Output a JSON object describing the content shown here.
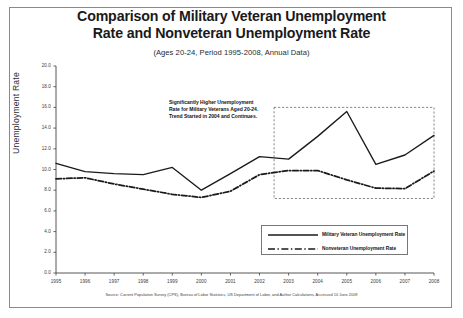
{
  "figure": {
    "title": "Comparison of Military Veteran Unemployment Rate and Nonveteran Unemployment Rate",
    "title_line1": "Comparison of Military Veteran Unemployment",
    "title_line2": "Rate and Nonveteran Unemployment Rate",
    "subtitle": "(Ages 20-24, Period 1995-2008, Annual Data)",
    "source_note": "Source: Current Population Survey (CPS), Bureau of Labor Statistics, US Department of Labor, and Author Calculations, Accessed 10 June 2009",
    "annotation": "Significantly Higher Unemployment Rate for Military Veterans Aged 20-24. Trend Started in 2004 and Continues.",
    "annotation_lines": [
      "Significantly Higher Unemployment",
      "Rate for Military Veterans Aged 20-24.",
      "Trend Started in 2004 and Continues."
    ]
  },
  "colors": {
    "line": "#1a1a1a",
    "frame": "#8a8a8a",
    "axis": "#444444",
    "highlight_box": "#555555",
    "background": "#ffffff"
  },
  "chart_data": {
    "type": "line",
    "title": "Comparison of Military Veteran Unemployment Rate and Nonveteran Unemployment Rate",
    "subtitle": "(Ages 20-24, Period 1995-2008, Annual Data)",
    "xlabel": "",
    "ylabel": "Unemployment Rate",
    "x": [
      1995,
      1996,
      1997,
      1998,
      1999,
      2000,
      2001,
      2002,
      2003,
      2004,
      2005,
      2006,
      2007,
      2008
    ],
    "categories": [
      "1995",
      "1996",
      "1997",
      "1998",
      "1999",
      "2000",
      "2001",
      "2002",
      "2003",
      "2004",
      "2005",
      "2006",
      "2007",
      "2008"
    ],
    "xlim": [
      1995,
      2008
    ],
    "ylim": [
      0.0,
      20.0
    ],
    "ytick_labels": [
      "0.0",
      "2.0",
      "4.0",
      "6.0",
      "8.0",
      "10.0",
      "12.0",
      "14.0",
      "16.0",
      "18.0",
      "20.0"
    ],
    "yticks": [
      0.0,
      2.0,
      4.0,
      6.0,
      8.0,
      10.0,
      12.0,
      14.0,
      16.0,
      18.0,
      20.0
    ],
    "grid": false,
    "legend_position": "lower right",
    "series": [
      {
        "name": "Military Veteran Unemployment Rate",
        "style": "solid",
        "values": [
          10.6,
          9.8,
          9.6,
          9.5,
          10.2,
          8.0,
          9.6,
          11.25,
          11.0,
          13.2,
          15.6,
          10.5,
          11.4,
          13.3
        ]
      },
      {
        "name": "Nonveteran Unemployment Rate",
        "style": "dash-dot",
        "values": [
          9.1,
          9.2,
          8.6,
          8.1,
          7.6,
          7.3,
          7.9,
          9.5,
          9.9,
          9.9,
          9.0,
          8.2,
          8.15,
          9.85
        ]
      }
    ],
    "highlight_box": {
      "x_range": [
        2002.5,
        2008.0
      ],
      "y_range": [
        7.2,
        16.0
      ],
      "style": "dashed"
    }
  },
  "legend": {
    "items": [
      {
        "label": "Military Veteran Unemployment Rate",
        "style": "solid"
      },
      {
        "label": "Nonveteran Unemployment Rate",
        "style": "dash-dot"
      }
    ]
  }
}
